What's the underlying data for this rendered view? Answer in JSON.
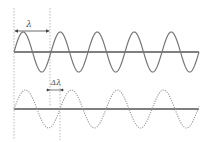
{
  "diagram": {
    "title": "",
    "labels": {
      "wavelength": "λ",
      "delta_wavelength": "Δλ"
    },
    "colors": {
      "axis": "#555555",
      "wave": "#777777",
      "guide": "#bbbbbb",
      "arrow": "#444444"
    },
    "top_wave": {
      "style": "solid",
      "baseline_y": 52,
      "amplitude": 20,
      "period": 37,
      "x_start": 14,
      "x_end": 199
    },
    "bottom_wave": {
      "style": "dotted",
      "baseline_y": 109,
      "amplitude": 19,
      "period": 46,
      "x_start": 14,
      "x_end": 199
    }
  }
}
